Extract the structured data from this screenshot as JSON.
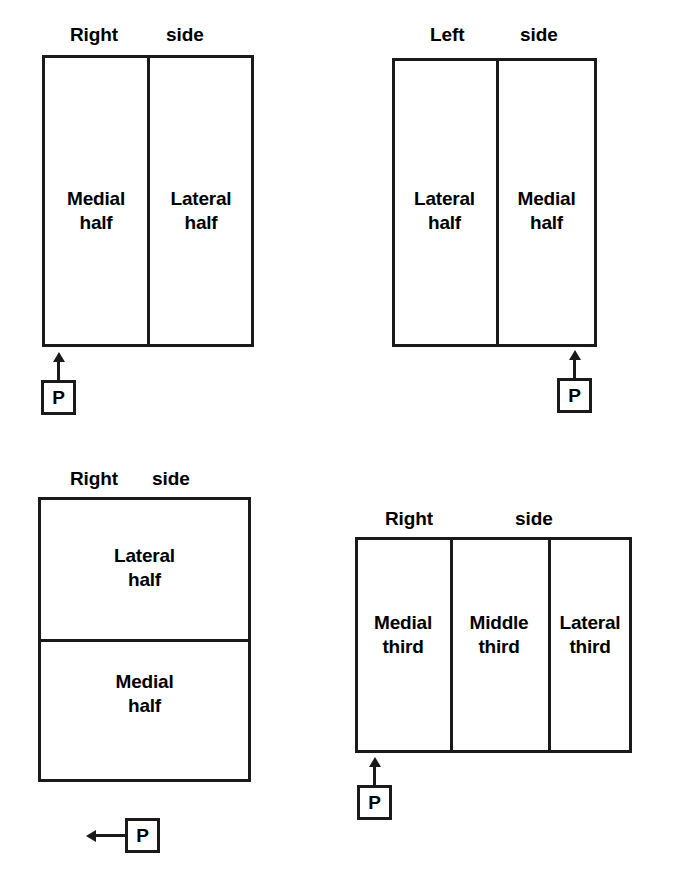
{
  "figure": {
    "background_color": "#ffffff",
    "ink_color": "#1a1a1a",
    "marker_letter": "P"
  },
  "diagrams": [
    {
      "id": "diagram-top-left",
      "heading_primary": "Right",
      "heading_secondary": "side",
      "orientation": "vertical-split",
      "marker": {
        "letter": "P",
        "arrow_direction": "up",
        "position": "below-left"
      },
      "cells": [
        {
          "name": "medial-half",
          "line1": "Medial",
          "line2": "half"
        },
        {
          "name": "lateral-half",
          "line1": "Lateral",
          "line2": "half"
        }
      ]
    },
    {
      "id": "diagram-top-right",
      "heading_primary": "Left",
      "heading_secondary": "side",
      "orientation": "vertical-split",
      "marker": {
        "letter": "P",
        "arrow_direction": "up",
        "position": "below-right"
      },
      "cells": [
        {
          "name": "lateral-half",
          "line1": "Lateral",
          "line2": "half"
        },
        {
          "name": "medial-half",
          "line1": "Medial",
          "line2": "half"
        }
      ]
    },
    {
      "id": "diagram-bottom-left",
      "heading_primary": "Right",
      "heading_secondary": "side",
      "orientation": "horizontal-split",
      "marker": {
        "letter": "P",
        "arrow_direction": "left",
        "position": "below-center"
      },
      "cells": [
        {
          "name": "lateral-half",
          "line1": "Lateral",
          "line2": "half"
        },
        {
          "name": "medial-half",
          "line1": "Medial",
          "line2": "half"
        }
      ]
    },
    {
      "id": "diagram-bottom-right",
      "heading_primary": "Right",
      "heading_secondary": "side",
      "orientation": "vertical-thirds",
      "marker": {
        "letter": "P",
        "arrow_direction": "up",
        "position": "below-left"
      },
      "cells": [
        {
          "name": "medial-third",
          "line1": "Medial",
          "line2": "third"
        },
        {
          "name": "middle-third",
          "line1": "Middle",
          "line2": "third"
        },
        {
          "name": "lateral-third",
          "line1": "Lateral",
          "line2": "third"
        }
      ]
    }
  ]
}
